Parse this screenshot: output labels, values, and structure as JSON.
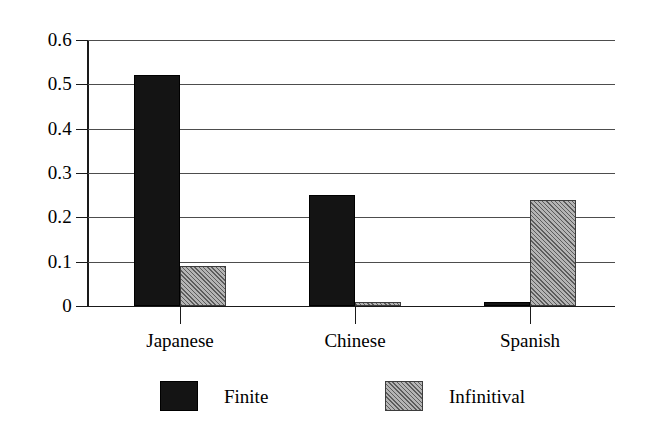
{
  "chart_data": {
    "type": "bar",
    "title": "",
    "subtitle": "",
    "xlabel": "",
    "ylabel": "",
    "categories": [
      "Japanese",
      "Chinese",
      "Spanish"
    ],
    "series": [
      {
        "name": "Finite",
        "values": [
          0.52,
          0.25,
          0.01
        ],
        "fill": "solid-black",
        "color": "#141414"
      },
      {
        "name": "Infinitival",
        "values": [
          0.09,
          0.01,
          0.24
        ],
        "fill": "diagonal-hatch",
        "color": "#b4b4b4"
      }
    ],
    "ylim": [
      0,
      0.6
    ],
    "ytick_values": [
      0,
      0.1,
      0.2,
      0.3,
      0.4,
      0.5,
      0.6
    ],
    "ytick_labels": [
      "0",
      "0.1",
      "0.2",
      "0.3",
      "0.4",
      "0.5",
      "0.6"
    ],
    "grid": true,
    "grid_axis": "y",
    "legend_position": "bottom-center",
    "annotations": []
  },
  "axes": {
    "y": {
      "ticks": [
        {
          "label": "0.6",
          "value": 0.6
        },
        {
          "label": "0.5",
          "value": 0.5
        },
        {
          "label": "0.4",
          "value": 0.4
        },
        {
          "label": "0.3",
          "value": 0.3
        },
        {
          "label": "0.2",
          "value": 0.2
        },
        {
          "label": "0.1",
          "value": 0.1
        },
        {
          "label": "0",
          "value": 0
        }
      ]
    },
    "x": {
      "ticks": [
        {
          "label": "Japanese"
        },
        {
          "label": "Chinese"
        },
        {
          "label": "Spanish"
        }
      ]
    }
  },
  "legend": {
    "items": [
      {
        "label": "Finite",
        "swatch": "solid-black-swatch"
      },
      {
        "label": "Infinitival",
        "swatch": "diagonal-hatch-swatch"
      }
    ]
  }
}
